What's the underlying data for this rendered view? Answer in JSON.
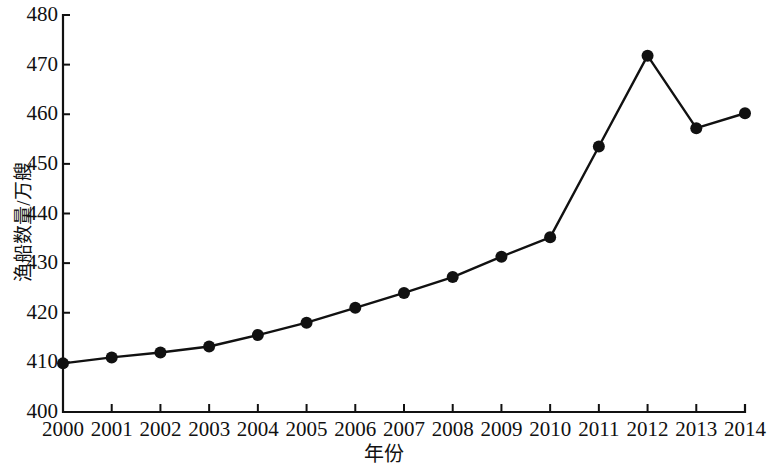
{
  "chart_data": {
    "type": "line",
    "title": "",
    "subtitle": "",
    "xlabel": "年份",
    "ylabel": "渔船数量/万艘",
    "categories": [
      "2000",
      "2001",
      "2002",
      "2003",
      "2004",
      "2005",
      "2006",
      "2007",
      "2008",
      "2009",
      "2010",
      "2011",
      "2012",
      "2013",
      "2014"
    ],
    "x": [
      2000,
      2001,
      2002,
      2003,
      2004,
      2005,
      2006,
      2007,
      2008,
      2009,
      2010,
      2011,
      2012,
      2013,
      2014
    ],
    "values": [
      409.8,
      411.0,
      412.0,
      413.2,
      415.5,
      418.0,
      421.0,
      424.0,
      427.2,
      431.3,
      435.2,
      453.5,
      471.8,
      457.2,
      460.2
    ],
    "series": [
      {
        "name": "渔船数量",
        "values": [
          409.8,
          411.0,
          412.0,
          413.2,
          415.5,
          418.0,
          421.0,
          424.0,
          427.2,
          431.3,
          435.2,
          453.5,
          471.8,
          457.2,
          460.2
        ],
        "color": "#111111",
        "marker": "circle",
        "line_width": 2.4,
        "marker_size": 6
      }
    ],
    "ylim": [
      400,
      480
    ],
    "yticks": [
      400,
      410,
      420,
      430,
      440,
      450,
      460,
      470,
      480
    ],
    "ytick_labels": [
      "400",
      "410",
      "420",
      "430",
      "440",
      "450",
      "460",
      "470",
      "480"
    ],
    "xlim": [
      2000,
      2014
    ],
    "xticks": [
      2000,
      2001,
      2002,
      2003,
      2004,
      2005,
      2006,
      2007,
      2008,
      2009,
      2010,
      2011,
      2012,
      2013,
      2014
    ],
    "xtick_labels": [
      "2000",
      "2001",
      "2002",
      "2003",
      "2004",
      "2005",
      "2006",
      "2007",
      "2008",
      "2009",
      "2010",
      "2011",
      "2012",
      "2013",
      "2014"
    ],
    "grid": false,
    "legend": false,
    "legend_position": "none",
    "axis_color": "#111111",
    "background_color": "#ffffff",
    "annotations": []
  },
  "figure": {
    "width": 767,
    "height": 470,
    "plot_left": 63,
    "plot_right": 745,
    "plot_top": 15,
    "plot_bottom": 412
  }
}
